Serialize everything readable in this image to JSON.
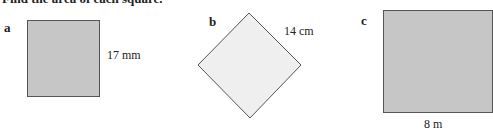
{
  "heading": "Find the area of each square.",
  "colors": {
    "square_fill_dark": "#c6c6c6",
    "square_fill_light": "#efefef",
    "outline": "#555555"
  },
  "figures": [
    {
      "label": "a",
      "side": "17 mm"
    },
    {
      "label": "b",
      "side": "14 cm"
    },
    {
      "label": "c",
      "side": "8 m"
    }
  ]
}
